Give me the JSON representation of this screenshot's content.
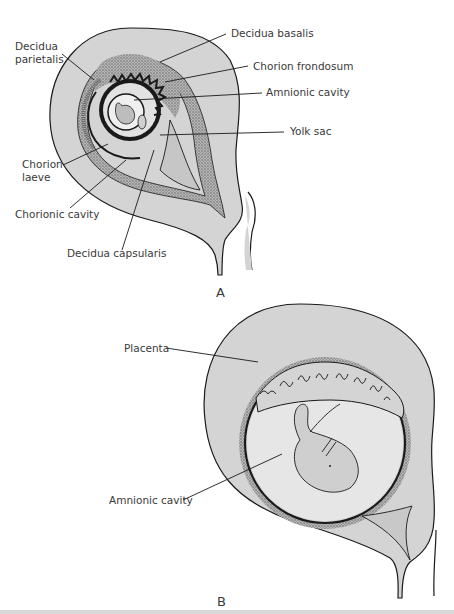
{
  "figure": {
    "panels": [
      {
        "id": "A",
        "letter": "A",
        "labels": {
          "decidua_parietalis_1": "Decidua",
          "decidua_parietalis_2": "parietalis",
          "decidua_basalis": "Decidua basalis",
          "chorion_frondosum": "Chorion frondosum",
          "amnionic_cavity": "Amnionic cavity",
          "yolk_sac": "Yolk sac",
          "chorion_laeve_1": "Chorion",
          "chorion_laeve_2": "laeve",
          "chorionic_cavity": "Chorionic cavity",
          "decidua_capsularis": "Decidua capsularis"
        }
      },
      {
        "id": "B",
        "letter": "B",
        "labels": {
          "placenta": "Placenta",
          "amnionic_cavity": "Amnionic cavity"
        }
      }
    ],
    "colors": {
      "uterus_fill": "#d4d4d4",
      "cavity_fill": "#e8e8e8",
      "line": "#1a1a1a",
      "stipple": "#8a8a8a",
      "label_text": "#3a3a3a"
    }
  }
}
